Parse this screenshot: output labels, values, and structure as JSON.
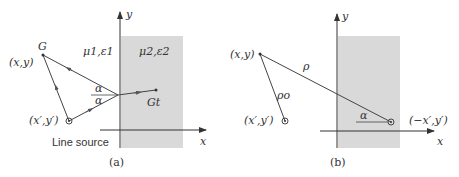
{
  "panel_a": {
    "caption": "(a)",
    "axis_x": "x",
    "axis_y": "y",
    "region1": "μ1,ε1",
    "region2": "μ2,ε2",
    "point_field": "(x,y)",
    "label_G": "G",
    "label_Gt": "Gt",
    "point_source": "(x′,y′)",
    "source_label": "Line source",
    "angle_top": "α",
    "angle_bottom": "α"
  },
  "panel_b": {
    "caption": "(b)",
    "axis_x": "x",
    "axis_y": "y",
    "point_field": "(x,y)",
    "point_source": "(x′,y′)",
    "point_image": "(−x′,y′)",
    "rho": "ρ",
    "rho_o": "ρo",
    "angle": "α"
  },
  "colors": {
    "shade": "#d9d9d9",
    "line": "#333333"
  }
}
